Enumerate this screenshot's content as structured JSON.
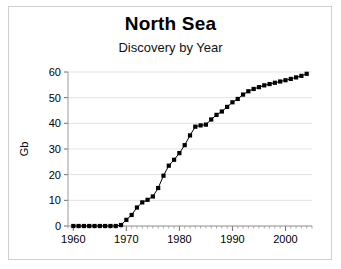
{
  "chart_data": {
    "type": "line",
    "title": "North Sea",
    "subtitle": "Discovery by Year",
    "xlabel": "",
    "ylabel": "Gb",
    "xlim": [
      1959,
      2005
    ],
    "ylim": [
      0,
      60
    ],
    "grid": true,
    "legend": null,
    "marker": "square",
    "series_color": "#000000",
    "x_major_ticks": [
      1960,
      1970,
      1980,
      1990,
      2000
    ],
    "x_tick_labels": [
      "1960",
      "1970",
      "1980",
      "1990",
      "2000"
    ],
    "x_minor_tick_interval": 1,
    "y_ticks": [
      0,
      10,
      20,
      30,
      40,
      50,
      60
    ],
    "y_tick_labels": [
      "0",
      "10",
      "20",
      "30",
      "40",
      "50",
      "60"
    ],
    "x": [
      1960,
      1961,
      1962,
      1963,
      1964,
      1965,
      1966,
      1967,
      1968,
      1969,
      1970,
      1971,
      1972,
      1973,
      1974,
      1975,
      1976,
      1977,
      1978,
      1979,
      1980,
      1981,
      1982,
      1983,
      1984,
      1985,
      1986,
      1987,
      1988,
      1989,
      1990,
      1991,
      1992,
      1993,
      1994,
      1995,
      1996,
      1997,
      1998,
      1999,
      2000,
      2001,
      2002,
      2003,
      2004
    ],
    "series": [
      {
        "name": "Cumulative discovery",
        "values": [
          0,
          0,
          0,
          0,
          0,
          0,
          0,
          0,
          0,
          0.4,
          2.4,
          4.3,
          7.2,
          9.2,
          10.2,
          11.5,
          14.8,
          19.6,
          23.5,
          25.8,
          28.4,
          31.5,
          35.3,
          38.7,
          39.2,
          39.5,
          41.5,
          43.3,
          44.6,
          46.4,
          48.2,
          49.5,
          51.2,
          52.5,
          53.4,
          54.1,
          54.8,
          55.3,
          55.8,
          56.3,
          56.8,
          57.3,
          57.9,
          58.5,
          59.3
        ]
      }
    ]
  },
  "axes_geometry": {
    "plot_left_px": 68,
    "plot_right_px": 312,
    "plot_top_px": 72,
    "plot_bottom_px": 226
  }
}
